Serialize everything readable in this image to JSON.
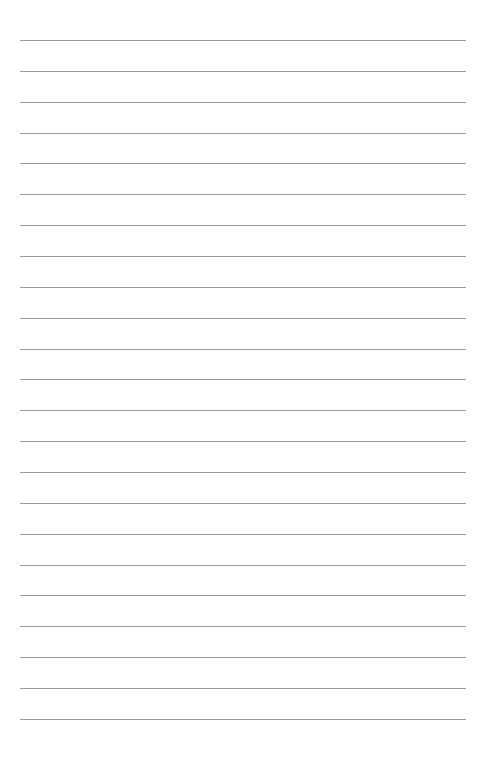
{
  "page": {
    "type": "lined-paper",
    "background_color": "#ffffff",
    "rule_color": "#8a8a8a",
    "rule_count": 23,
    "rule_left": 20,
    "rule_right": 466,
    "first_rule_y": 40,
    "rule_spacing": 30.86
  }
}
